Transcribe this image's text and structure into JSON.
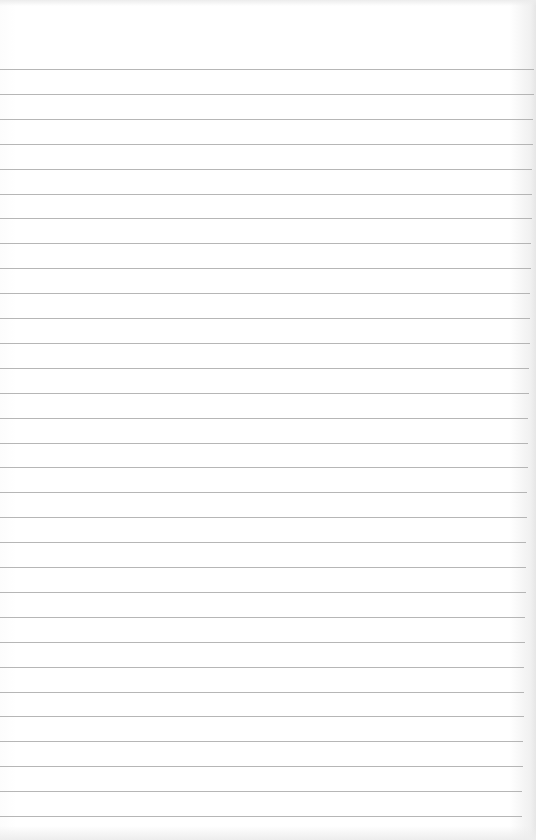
{
  "paper": {
    "type": "ruled-lined-paper",
    "line_color": "#a9a9a9",
    "background_color": "#ffffff",
    "first_line_y": 69,
    "line_spacing": 24.9,
    "line_count": 31,
    "line_right_inset_top": 2,
    "line_right_inset_bottom": 14
  }
}
